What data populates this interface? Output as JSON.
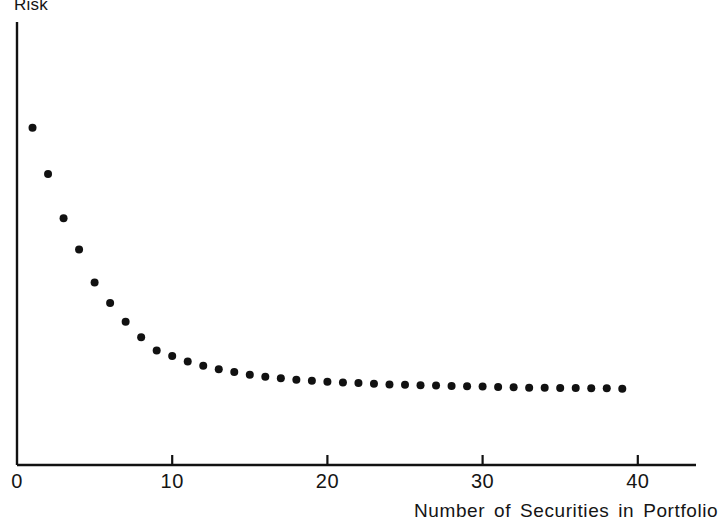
{
  "figure": {
    "background_color": "#ffffff",
    "ink_color": "#111111"
  },
  "axes": {
    "y_axis_title": "Risk",
    "x_axis_title": "Number of Securities in Portfolio",
    "x_tick_labels": [
      "0",
      "10",
      "20",
      "30",
      "40"
    ],
    "y_tick_labels": []
  },
  "chart_data": {
    "type": "scatter",
    "title": "",
    "subtitle": "",
    "xlabel": "Number of Securities in Portfolio",
    "ylabel": "Risk",
    "xlim": [
      0,
      44
    ],
    "ylim": [
      0,
      100
    ],
    "xticks": [
      0,
      10,
      20,
      30,
      40
    ],
    "yticks": [],
    "grid": false,
    "legend": null,
    "annotations": [],
    "marker": "filled-circle",
    "marker_color": "#111111",
    "marker_size_px": 8,
    "series": [
      {
        "name": "Portfolio risk",
        "x": [
          1,
          2,
          3,
          4,
          5,
          6,
          7,
          8,
          9,
          10,
          11,
          12,
          13,
          14,
          15,
          16,
          17,
          18,
          19,
          20,
          21,
          22,
          23,
          24,
          25,
          26,
          27,
          28,
          29,
          30,
          31,
          32,
          33,
          34,
          35,
          36,
          37,
          38,
          39
        ],
        "y": [
          84.0,
          70.7,
          58.0,
          49.0,
          39.5,
          33.6,
          28.2,
          23.8,
          20.0,
          18.4,
          16.8,
          15.6,
          14.6,
          13.8,
          13.0,
          12.4,
          12.0,
          11.6,
          11.3,
          11.0,
          10.8,
          10.6,
          10.4,
          10.2,
          10.1,
          10.0,
          9.9,
          9.8,
          9.7,
          9.6,
          9.5,
          9.4,
          9.3,
          9.3,
          9.2,
          9.2,
          9.1,
          9.1,
          9.0
        ]
      }
    ]
  },
  "geometry": {
    "origin_x_px": 17,
    "origin_y_px": 465,
    "px_per_x_unit": 15.52,
    "y_axis_top_px": 22,
    "x_axis_right_px": 696,
    "y_value_top_px": 72,
    "y_value_bottom_px": 420
  }
}
